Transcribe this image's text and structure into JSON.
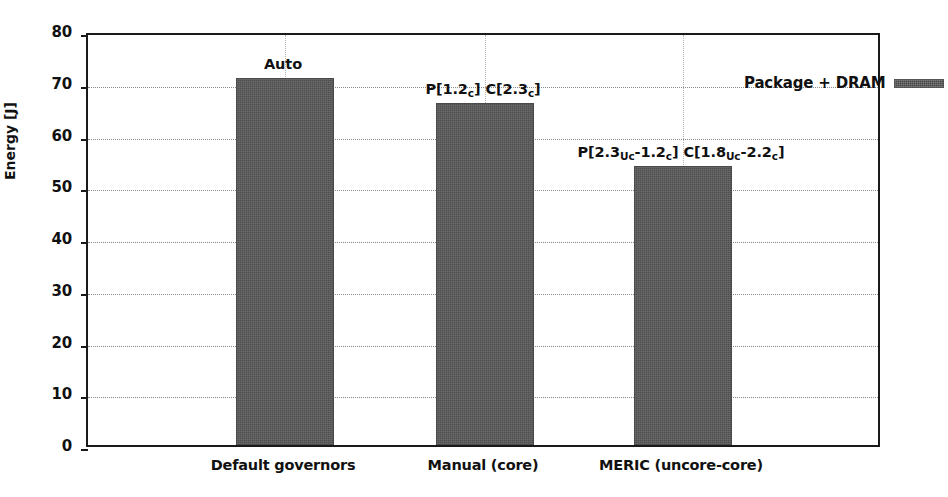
{
  "chart_data": {
    "type": "bar",
    "title": "",
    "xlabel": "",
    "ylabel": "Energy [J]",
    "ylim": [
      0,
      80
    ],
    "ytick_step": 10,
    "yticks": [
      "0",
      "10",
      "20",
      "30",
      "40",
      "50",
      "60",
      "70",
      "80"
    ],
    "grid": "horizontal dotted gridlines at each y tick; faint vertical dotted gridlines at bar centers",
    "legend": {
      "position": "upper right (inside axes)",
      "entries": [
        {
          "label": "Package + DRAM",
          "color": "#595959"
        }
      ]
    },
    "categories": [
      "Default governors",
      "Manual (core)",
      "MERIC (uncore-core)"
    ],
    "values": [
      71,
      66,
      54
    ],
    "series": [
      {
        "name": "Package + DRAM",
        "color": "#595959",
        "values": [
          71,
          66,
          54
        ]
      }
    ],
    "annotations": [
      {
        "category": "Default governors",
        "text": "Auto",
        "parts": [
          {
            "t": "Auto"
          }
        ]
      },
      {
        "category": "Manual (core)",
        "text": "P[1.2c] C[2.3c]",
        "parts": [
          {
            "t": "P[1.2"
          },
          {
            "sub": "c"
          },
          {
            "t": "] C[2.3"
          },
          {
            "sub": "c"
          },
          {
            "t": "]"
          }
        ]
      },
      {
        "category": "MERIC (uncore-core)",
        "text": "P[2.3Uc-1.2c] C[1.8Uc-2.2c]",
        "parts": [
          {
            "t": "P[2.3"
          },
          {
            "sub": "Uc"
          },
          {
            "t": "-1.2"
          },
          {
            "sub": "c"
          },
          {
            "t": "] C[1.8"
          },
          {
            "sub": "Uc"
          },
          {
            "t": "-2.2"
          },
          {
            "sub": "c"
          },
          {
            "t": "]"
          }
        ]
      }
    ],
    "colors": {
      "bar_fill": "#595959",
      "axis": "#1a1a1a",
      "gridline": "#8a8a8a",
      "text": "#111111",
      "background": "#ffffff"
    }
  }
}
